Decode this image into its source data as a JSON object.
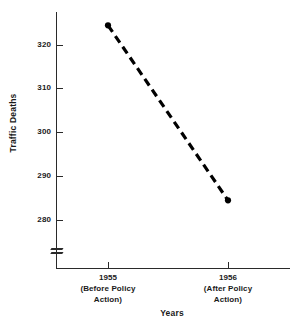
{
  "chart_data": {
    "type": "line",
    "title": "",
    "title_remnant": "",
    "xlabel": "Years",
    "ylabel": "Traffic Deaths",
    "categories": [
      "1955",
      "1956"
    ],
    "category_sublabels": [
      "(Before Policy\nAction)",
      "(After Policy\nAction)"
    ],
    "x": [
      1955,
      1956
    ],
    "values": [
      324.5,
      284.5
    ],
    "series": [
      {
        "name": "Traffic Deaths",
        "values": [
          324.5,
          284.5
        ],
        "style": "dashed",
        "color": "#000000",
        "marker": "filled-circle"
      }
    ],
    "ylim": [
      275,
      326
    ],
    "yticks": [
      280,
      290,
      300,
      310,
      320
    ],
    "ytick_labels": [
      "280",
      "290",
      "300",
      "310",
      "320"
    ],
    "y_axis_break": true,
    "y_axis_break_note": "axis break below 280",
    "grid": false,
    "legend": false,
    "legend_position": "none"
  },
  "axis": {
    "x_categories": [
      {
        "year": "1955",
        "line2": "(Before Policy",
        "line3": "Action)"
      },
      {
        "year": "1956",
        "line2": "(After Policy",
        "line3": "Action)"
      }
    ],
    "y_labels": [
      "320",
      "310",
      "300",
      "290",
      "280"
    ]
  },
  "colors": {
    "ink": "#1a1a1a",
    "axis": "#2a2a2a",
    "series": "#000000",
    "background": "#ffffff"
  }
}
